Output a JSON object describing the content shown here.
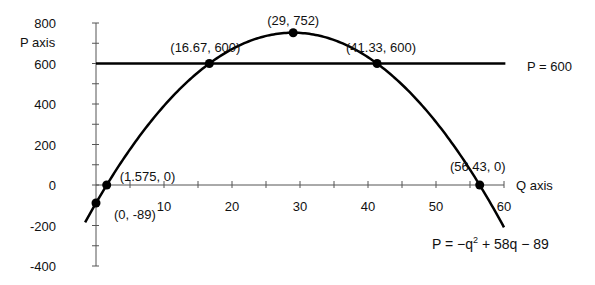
{
  "chart_data": {
    "type": "line",
    "title": "",
    "xlabel": "Q axis",
    "ylabel": "P axis",
    "xlim": [
      0,
      60
    ],
    "ylim": [
      -400,
      800
    ],
    "x_ticks": [
      10,
      20,
      30,
      40,
      50,
      60
    ],
    "x_minor_step": 5,
    "y_ticks": [
      800,
      600,
      400,
      200,
      0,
      -200,
      -400
    ],
    "y_minor_step": 100,
    "grid": false,
    "series": [
      {
        "name": "P = -q^2 + 58q - 89",
        "kind": "curve",
        "equation": {
          "a": -1,
          "b": 58,
          "c": -89
        },
        "x_range": [
          -1.6,
          60
        ],
        "label": {
          "main": "P = −q",
          "sup": "2",
          "rest": " + 58q − 89"
        }
      },
      {
        "name": "P = 600",
        "kind": "horizontal",
        "y": 600,
        "x_range": [
          0,
          60.2
        ],
        "label": "P = 600"
      }
    ],
    "points": [
      {
        "x": 0,
        "y": -89,
        "label": "(0, -89)"
      },
      {
        "x": 1.575,
        "y": 0,
        "label": "(1.575, 0)"
      },
      {
        "x": 16.67,
        "y": 600,
        "label": "(16.67, 600)"
      },
      {
        "x": 29,
        "y": 752,
        "label": "(29, 752)"
      },
      {
        "x": 41.33,
        "y": 600,
        "label": "(41.33, 600)"
      },
      {
        "x": 56.43,
        "y": 0,
        "label": "(56.43, 0)"
      }
    ],
    "colors": {
      "line": "#000000",
      "axis": "#555555",
      "text": "#111111"
    }
  }
}
